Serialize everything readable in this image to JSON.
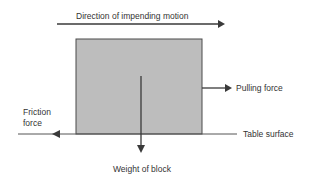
{
  "diagram": {
    "labels": {
      "motion": "Direction of impending motion",
      "pulling": "Pulling force",
      "friction_line1": "Friction",
      "friction_line2": "force",
      "table": "Table surface",
      "weight": "Weight of block"
    },
    "colors": {
      "block_fill": "#bdbdbd",
      "block_stroke": "#4a4a4a",
      "arrow": "#3a3a3a",
      "table_line": "#555555"
    }
  }
}
